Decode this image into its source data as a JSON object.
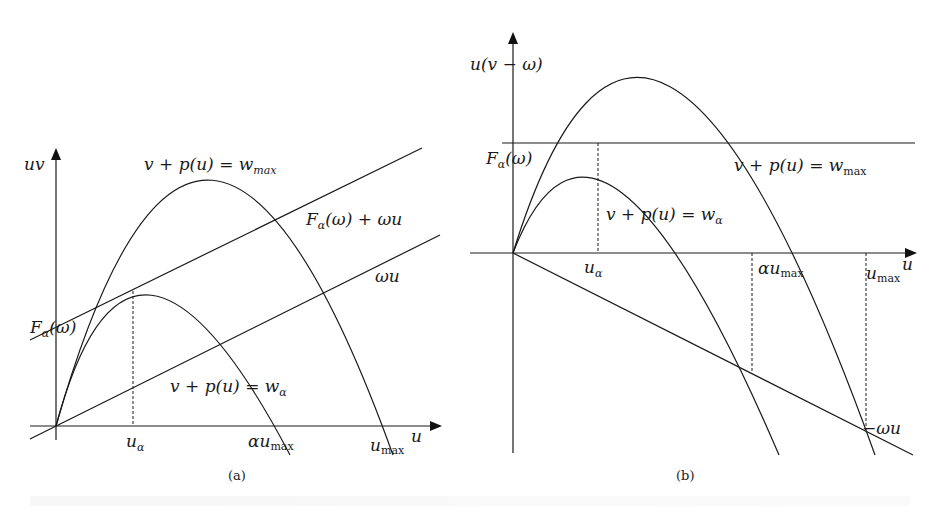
{
  "figure": {
    "panel_a": {
      "caption": "(a)",
      "y_axis_label": "uv",
      "x_axis_label": "u",
      "curves": {
        "outer": "v + p(u) = w_max",
        "inner": "v + p(u) = w_α",
        "tangent_line": "F_α(ω) + ωu",
        "omega_line": "ωu"
      },
      "ticks": {
        "u_alpha": "u_α",
        "alpha_umax": "αu_max",
        "umax": "u_max"
      },
      "intercept_label": "F_α(ω)"
    },
    "panel_b": {
      "caption": "(b)",
      "y_axis_label": "u(v − ω)",
      "x_axis_label": "u",
      "curves": {
        "outer": "v + p(u) = w_max",
        "inner": "v + p(u) = w_α",
        "neg_omega_line": "−ωu"
      },
      "ticks": {
        "u_alpha": "u_α",
        "alpha_umax": "αu_max",
        "umax": "u_max"
      },
      "level_label": "F_α(ω)"
    },
    "footer_caption": "Fig. 5.1"
  },
  "text": {
    "a_uv": "uv",
    "a_wmax_main": "v + p(u) = w",
    "a_wmax_sub": "max",
    "a_tangent_main": "F",
    "a_tangent_sub": "α",
    "a_tangent_rest": "(ω) + ωu",
    "a_omega": "ωu",
    "a_F": "F",
    "a_F_sub": "α",
    "a_F_rest": "(ω)",
    "a_walpha_main": "v + p(u) = w",
    "a_walpha_sub": "α",
    "a_ualpha": "u",
    "a_ualpha_sub": "α",
    "a_aumax": "αu",
    "a_aumax_sub": "max",
    "a_umax": "u",
    "a_umax_sub": "max",
    "a_u": "u",
    "a_caption": "(a)",
    "b_ylabel": "u(v − ω)",
    "b_F": "F",
    "b_F_sub": "α",
    "b_F_rest": "(ω)",
    "b_wmax_main": "v + p(u) = w",
    "b_wmax_sub": "max",
    "b_walpha_main": "v + p(u) = w",
    "b_walpha_sub": "α",
    "b_ualpha": "u",
    "b_ualpha_sub": "α",
    "b_aumax": "αu",
    "b_aumax_sub": "max",
    "b_umax": "u",
    "b_umax_sub": "max",
    "b_u": "u",
    "b_negomega": "−ωu",
    "b_caption": "(b)"
  }
}
